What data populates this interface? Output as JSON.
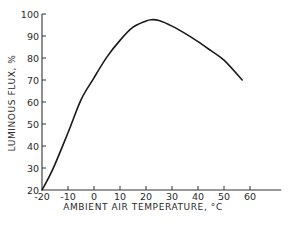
{
  "chart_data": {
    "type": "line",
    "title": "",
    "xlabel": "AMBIENT AIR TEMPERATURE, °C",
    "ylabel": "LUMINOUS FLUX, %",
    "xlim": [
      -20,
      72
    ],
    "ylim": [
      20,
      100
    ],
    "xticks": [
      -20,
      -10,
      0,
      10,
      20,
      30,
      40,
      50,
      60
    ],
    "yticks": [
      20,
      30,
      40,
      50,
      60,
      70,
      80,
      90,
      100
    ],
    "grid": false,
    "legend": null,
    "series": [
      {
        "name": "Luminous flux",
        "color": "#1a1a1a",
        "x": [
          -20,
          -16,
          -10,
          -5,
          0,
          5,
          10,
          15,
          20,
          22,
          25,
          30,
          35,
          40,
          45,
          50,
          57
        ],
        "y": [
          20,
          29,
          46,
          61,
          71,
          80.5,
          88,
          94,
          96.8,
          97.4,
          97,
          94.5,
          91.2,
          87.4,
          83.3,
          79,
          70
        ]
      }
    ]
  }
}
